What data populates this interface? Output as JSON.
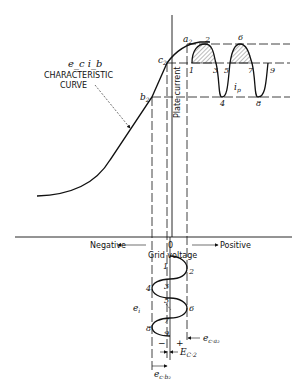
{
  "diagram": {
    "curve_label": {
      "symbol": "e_c i_b",
      "line1": "CHARACTERISTIC",
      "line2": "CURVE"
    },
    "axes": {
      "vertical_label": "Plate current",
      "horizontal_label": "Grid voltage",
      "origin": "0",
      "negative": "Negative",
      "positive": "Positive"
    },
    "points": {
      "a": "a",
      "a_sub": "2",
      "b": "b",
      "b_sub": "2",
      "c": "c",
      "c_sub": "2"
    },
    "plate_waveform": {
      "label": "i",
      "label_sub": "p",
      "markers": [
        "1",
        "2",
        "3",
        "4",
        "5",
        "6",
        "7",
        "8",
        "9"
      ]
    },
    "grid_waveform": {
      "label": "e",
      "label_sub": "i",
      "markers": [
        "1",
        "2",
        "3",
        "4",
        "5",
        "6",
        "7",
        "8",
        "9"
      ],
      "minus": "−",
      "plus": "+"
    },
    "dimensions": {
      "ec_a2": "e",
      "ec_a2_sub": "c·a₂",
      "Ec2": "E",
      "Ec2_sub": "C·2",
      "ec_b2": "e",
      "ec_b2_sub": "c·b₂"
    },
    "colors": {
      "ink": "#111111",
      "background": "#ffffff",
      "hatch": "#555555"
    }
  }
}
